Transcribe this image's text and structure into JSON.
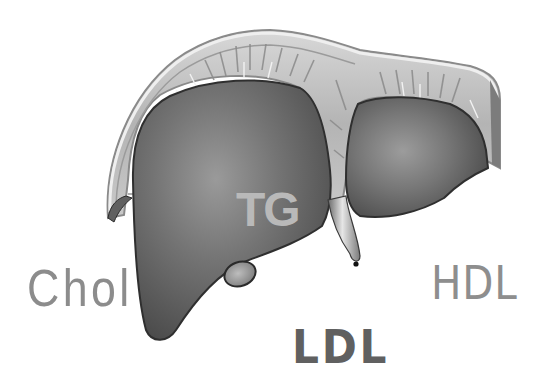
{
  "illustration": {
    "subject": "liver",
    "style": "grayscale anatomical drawing"
  },
  "labels": {
    "chol": {
      "text": "Chol",
      "color": "#8c8c8c"
    },
    "tg": {
      "text": "TG",
      "color": "#b9b9b9"
    },
    "hdl": {
      "text": "HDL",
      "color": "#8e8e8e"
    },
    "ldl": {
      "text": "LDL",
      "color": "#606060"
    }
  },
  "colors": {
    "background": "#ffffff",
    "capsule_light": "#cfcfcf",
    "capsule_mid": "#a9a9a9",
    "lobe_dark": "#5e5e5e",
    "lobe_highlight": "#8a8a8a",
    "outline": "#2e2e2e"
  }
}
